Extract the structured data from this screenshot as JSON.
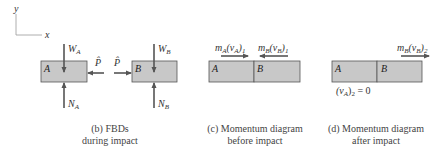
{
  "axes": {
    "y_label": "y",
    "x_label": "x"
  },
  "fbd": {
    "block_a_label": "A",
    "block_b_label": "B",
    "weight_a": {
      "main": "W",
      "sub": "A"
    },
    "normal_a": {
      "main": "N",
      "sub": "A"
    },
    "weight_b": {
      "main": "W",
      "sub": "B"
    },
    "normal_b": {
      "main": "N",
      "sub": "B"
    },
    "impulse_on_a": "P̂",
    "impulse_on_b": "P̂",
    "caption_line1": "(b) FBDs",
    "caption_line2": "during impact"
  },
  "before": {
    "block_a_label": "A",
    "block_b_label": "B",
    "momentum_a": {
      "m": "m",
      "msub": "A",
      "v": "(v",
      "vsub": "A",
      "close": ")",
      "time": "1"
    },
    "momentum_b": {
      "m": "m",
      "msub": "B",
      "v": "(v",
      "vsub": "B",
      "close": ")",
      "time": "1"
    },
    "caption_line1": "(c) Momentum diagram",
    "caption_line2": "before impact"
  },
  "after": {
    "block_a_label": "A",
    "block_b_label": "B",
    "momentum_b": {
      "m": "m",
      "msub": "B",
      "v": "(v",
      "vsub": "B",
      "close": ")",
      "time": "2"
    },
    "velocity_a": {
      "open": "(v",
      "vsub": "A",
      "close": ")",
      "time": "2",
      "eq": " = 0"
    },
    "caption_line1": "(d) Momentum diagram",
    "caption_line2": "after impact"
  },
  "colors": {
    "block_fill": "#c8c8c8",
    "block_stroke": "#555555",
    "arrow": "#555555",
    "axis": "#999999"
  }
}
